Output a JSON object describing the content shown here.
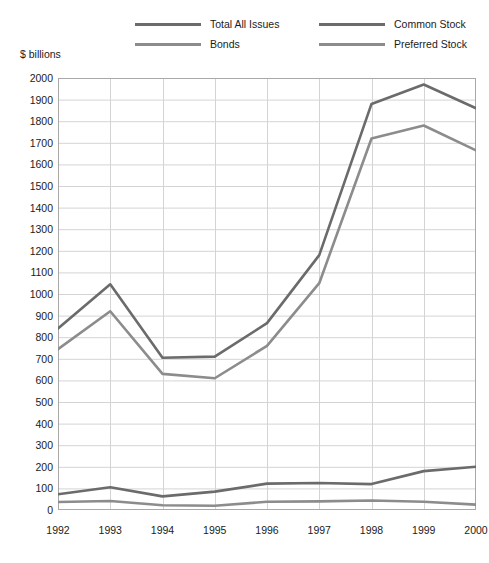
{
  "chart_data": {
    "type": "line",
    "title": "",
    "subtitle": "",
    "xlabel": "",
    "ylabel": "$ billions",
    "categories": [
      "1992",
      "1993",
      "1994",
      "1995",
      "1996",
      "1997",
      "1998",
      "1999",
      "2000"
    ],
    "x": [
      1992,
      1993,
      1994,
      1995,
      1996,
      1997,
      1998,
      1999,
      2000
    ],
    "xlim": [
      1992,
      2000
    ],
    "ylim": [
      0,
      2000
    ],
    "ytick_step": 100,
    "yticks": [
      0,
      100,
      200,
      300,
      400,
      500,
      600,
      700,
      800,
      900,
      1000,
      1100,
      1200,
      1300,
      1400,
      1500,
      1600,
      1700,
      1800,
      1900,
      2000
    ],
    "grid": true,
    "legend_position": "top",
    "series": [
      {
        "name": "Total All Issues",
        "color": "#6b6b6b",
        "values": [
          840,
          1045,
          705,
          710,
          865,
          1180,
          1880,
          1970,
          1860
        ]
      },
      {
        "name": "Bonds",
        "color": "#8c8c8c",
        "values": [
          745,
          920,
          630,
          610,
          760,
          1050,
          1720,
          1780,
          1665
        ]
      },
      {
        "name": "Common Stock",
        "color": "#6b6b6b",
        "values": [
          73,
          105,
          63,
          85,
          122,
          125,
          120,
          180,
          200
        ]
      },
      {
        "name": "Preferred Stock",
        "color": "#8c8c8c",
        "values": [
          37,
          42,
          22,
          20,
          38,
          40,
          44,
          38,
          25
        ]
      }
    ]
  },
  "legend": {
    "total_all_issues": "Total All Issues",
    "bonds": "Bonds",
    "common_stock": "Common Stock",
    "preferred_stock": "Preferred Stock"
  },
  "axis": {
    "unit_label": "$ billions"
  },
  "colors": {
    "series_dark": "#6b6b6b",
    "series_light": "#8c8c8c",
    "grid": "#d4d4d4",
    "frame": "#a8a8a8",
    "background": "#ffffff",
    "text": "#1b1b1b"
  }
}
